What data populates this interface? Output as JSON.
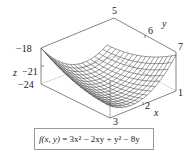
{
  "figure": {
    "type": "3d-surface-wireframe",
    "equation": {
      "lhs": "f(x, y)",
      "rhs": "3x² − 2xy + y² − 8y"
    }
  },
  "chart_data": {
    "type": "surface",
    "title": "",
    "function": "f(x, y) = 3x^2 - 2xy + y^2 - 8y",
    "axes": {
      "x": {
        "label": "x",
        "ticks": [
          "1",
          "2",
          "3"
        ],
        "range": [
          1,
          3
        ]
      },
      "y": {
        "label": "y",
        "ticks": [
          "5",
          "6",
          "7"
        ],
        "range": [
          5,
          7
        ]
      },
      "z": {
        "label": "z",
        "ticks": [
          "-18",
          "-21",
          "-24"
        ],
        "range": [
          -24,
          -18
        ]
      }
    },
    "minimum_approx": {
      "x": 2,
      "y": 6,
      "z": -24
    },
    "grid": false,
    "legend": "none",
    "box_frame": true
  },
  "labels": {
    "z_axis": "z",
    "z_ticks": [
      "−18",
      "−21",
      "−24"
    ],
    "y_axis": "y",
    "y_ticks": [
      "5",
      "6",
      "7"
    ],
    "x_axis": "x",
    "x_ticks": [
      "1",
      "2",
      "3"
    ]
  }
}
